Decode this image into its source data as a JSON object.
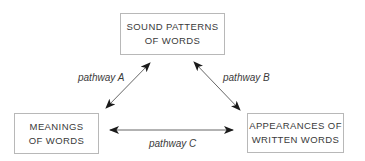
{
  "diagram": {
    "nodes": [
      {
        "id": "sound",
        "lines": [
          "SOUND PATTERNS",
          "OF WORDS"
        ]
      },
      {
        "id": "meanings",
        "lines": [
          "MEANINGS",
          "OF WORDS"
        ]
      },
      {
        "id": "appearances",
        "lines": [
          "APPEARANCES OF",
          "WRITTEN WORDS"
        ]
      }
    ],
    "edges": [
      {
        "id": "A",
        "from": "meanings",
        "to": "sound",
        "label": "pathway A",
        "bidirectional": true
      },
      {
        "id": "B",
        "from": "sound",
        "to": "appearances",
        "label": "pathway B",
        "bidirectional": true
      },
      {
        "id": "C",
        "from": "meanings",
        "to": "appearances",
        "label": "pathway C",
        "bidirectional": true
      }
    ],
    "colors": {
      "box_border": "#b8b8b8",
      "text": "#3a3a3a",
      "arrow": "#555555",
      "arrowhead": "#1a1a1a"
    }
  }
}
